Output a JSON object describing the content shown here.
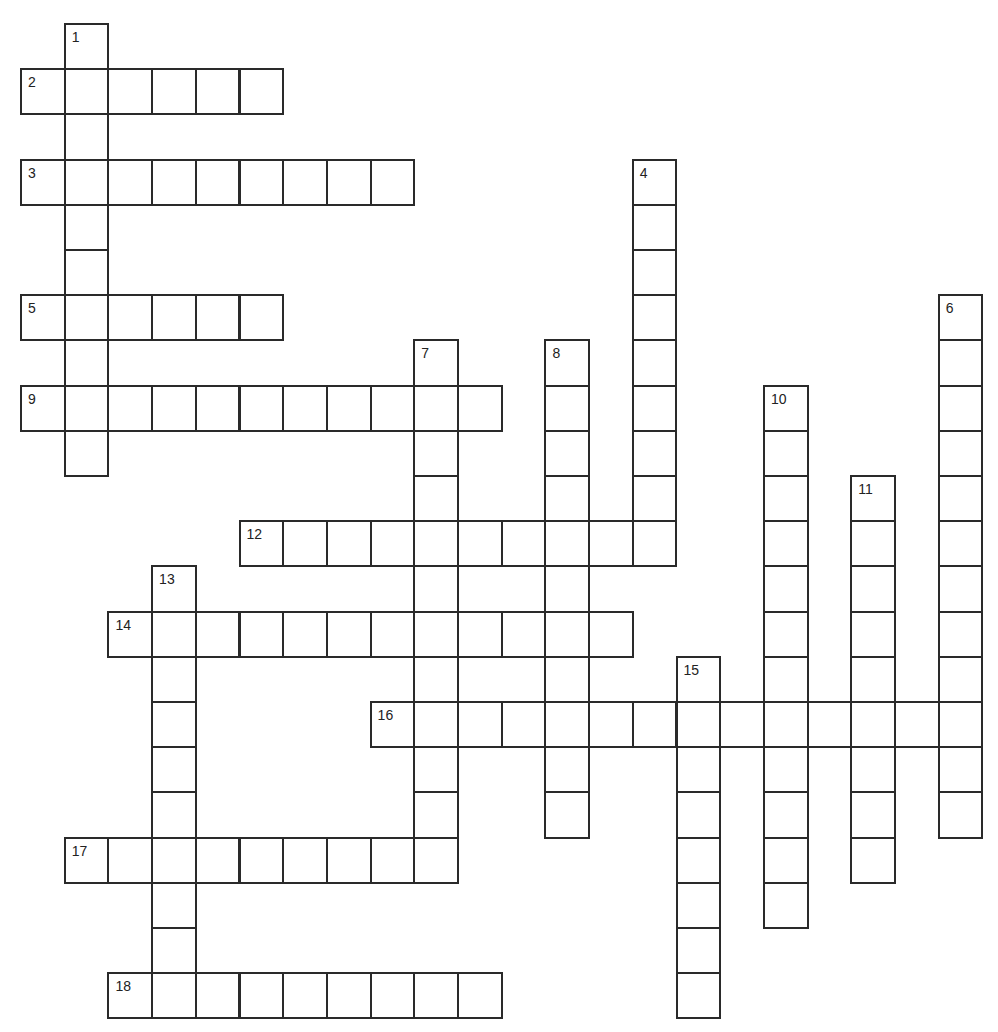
{
  "puzzle": {
    "type": "crossword",
    "grid": {
      "origin_x": 21,
      "origin_y": 24,
      "cell_width": 43.7,
      "cell_height": 45.2,
      "line_color": "#2a2a2a",
      "cell_fill": "#ffffff"
    },
    "words": [
      {
        "number": "1",
        "direction": "down",
        "row": 0,
        "col": 1,
        "length": 10
      },
      {
        "number": "2",
        "direction": "across",
        "row": 1,
        "col": 0,
        "length": 6
      },
      {
        "number": "3",
        "direction": "across",
        "row": 3,
        "col": 0,
        "length": 9
      },
      {
        "number": "4",
        "direction": "down",
        "row": 3,
        "col": 14,
        "length": 9
      },
      {
        "number": "5",
        "direction": "across",
        "row": 6,
        "col": 0,
        "length": 6
      },
      {
        "number": "6",
        "direction": "down",
        "row": 6,
        "col": 21,
        "length": 12
      },
      {
        "number": "7",
        "direction": "down",
        "row": 7,
        "col": 9,
        "length": 12
      },
      {
        "number": "8",
        "direction": "down",
        "row": 7,
        "col": 12,
        "length": 11
      },
      {
        "number": "9",
        "direction": "across",
        "row": 8,
        "col": 0,
        "length": 11
      },
      {
        "number": "10",
        "direction": "down",
        "row": 8,
        "col": 17,
        "length": 12
      },
      {
        "number": "11",
        "direction": "down",
        "row": 10,
        "col": 19,
        "length": 9
      },
      {
        "number": "12",
        "direction": "across",
        "row": 11,
        "col": 5,
        "length": 10
      },
      {
        "number": "13",
        "direction": "down",
        "row": 12,
        "col": 3,
        "length": 10
      },
      {
        "number": "14",
        "direction": "across",
        "row": 13,
        "col": 2,
        "length": 12
      },
      {
        "number": "15",
        "direction": "down",
        "row": 14,
        "col": 15,
        "length": 8
      },
      {
        "number": "16",
        "direction": "across",
        "row": 15,
        "col": 8,
        "length": 14
      },
      {
        "number": "17",
        "direction": "across",
        "row": 18,
        "col": 1,
        "length": 9
      },
      {
        "number": "18",
        "direction": "across",
        "row": 21,
        "col": 2,
        "length": 9
      }
    ]
  }
}
